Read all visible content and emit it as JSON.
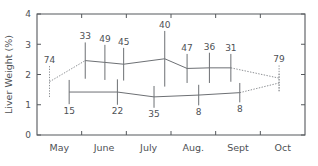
{
  "chart_data": {
    "type": "line",
    "title": "",
    "xlabel": "",
    "ylabel": "Liver Weight (%)",
    "ylim": [
      0,
      4
    ],
    "yticks": [
      "0",
      "1",
      "2",
      "3",
      "4"
    ],
    "categories": [
      "May",
      "June",
      "July",
      "Aug.",
      "Sept",
      "Oct"
    ],
    "xtick_labels": [
      "May",
      "June",
      "July",
      "Aug.",
      "Sept",
      "Oct"
    ],
    "grid": false,
    "legend": "none",
    "series": [
      {
        "name": "upper",
        "style": "solid-with-error-bars",
        "points": [
          {
            "x": 0.28,
            "y": 1.76,
            "n": "74",
            "err": 0.52,
            "dotted": true,
            "label_pos": "above"
          },
          {
            "x": 1.08,
            "y": 2.46,
            "n": "33",
            "err": 0.6,
            "dotted": false,
            "label_pos": "above"
          },
          {
            "x": 1.52,
            "y": 2.4,
            "n": "49",
            "err": 0.58,
            "dotted": false,
            "label_pos": "above"
          },
          {
            "x": 1.94,
            "y": 2.34,
            "n": "45",
            "err": 0.54,
            "dotted": false,
            "label_pos": "above"
          },
          {
            "x": 2.86,
            "y": 2.52,
            "n": "40",
            "err": 0.92,
            "dotted": false,
            "label_pos": "above"
          },
          {
            "x": 3.36,
            "y": 2.2,
            "n": "47",
            "err": 0.48,
            "dotted": false,
            "label_pos": "above"
          },
          {
            "x": 3.86,
            "y": 2.22,
            "n": "36",
            "err": 0.5,
            "dotted": false,
            "label_pos": "above"
          },
          {
            "x": 4.34,
            "y": 2.22,
            "n": "31",
            "err": 0.46,
            "dotted": false,
            "label_pos": "above"
          },
          {
            "x": 5.42,
            "y": 1.88,
            "n": "79",
            "err": 0.42,
            "dotted": true,
            "label_pos": "above"
          }
        ]
      },
      {
        "name": "lower",
        "style": "solid-with-error-bars",
        "points": [
          {
            "x": 0.72,
            "y": 1.42,
            "n": "15",
            "err": 0.4,
            "dotted": false,
            "label_pos": "below"
          },
          {
            "x": 1.8,
            "y": 1.42,
            "n": "22",
            "err": 0.42,
            "dotted": false,
            "label_pos": "below"
          },
          {
            "x": 2.62,
            "y": 1.26,
            "n": "35",
            "err": 0.36,
            "dotted": false,
            "label_pos": "below"
          },
          {
            "x": 3.62,
            "y": 1.32,
            "n": "8",
            "err": 0.34,
            "dotted": false,
            "label_pos": "below"
          },
          {
            "x": 4.54,
            "y": 1.4,
            "n": "8",
            "err": 0.32,
            "dotted": false,
            "label_pos": "below"
          },
          {
            "x": 5.42,
            "y": 1.72,
            "n": "",
            "err": 0.3,
            "dotted": true,
            "label_pos": "below"
          }
        ]
      }
    ],
    "colors": {
      "axis": "#55585c",
      "line": "#6d7074",
      "line_dotted": "#8d9094",
      "text": "#4e5155",
      "background": "#ffffff"
    }
  }
}
